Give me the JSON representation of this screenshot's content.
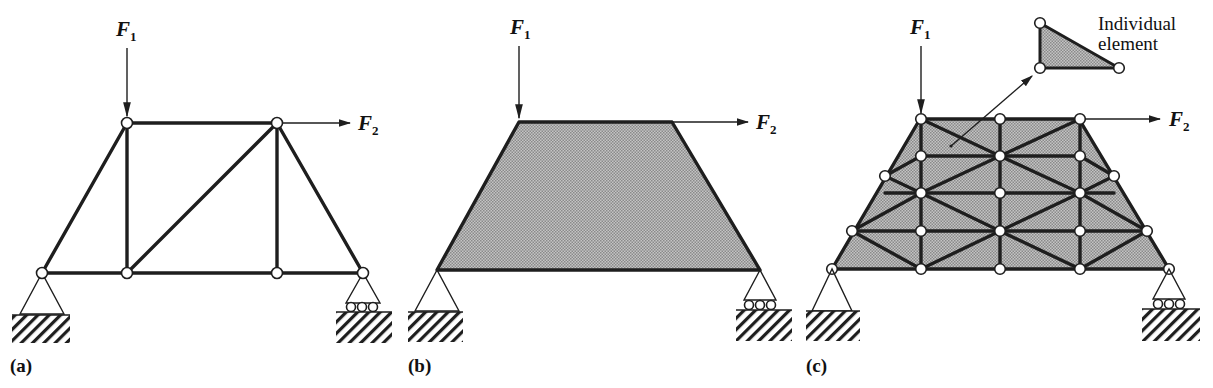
{
  "figure": {
    "panels": [
      {
        "id": "a",
        "label": "(a)",
        "description": "Truss structure",
        "forces": [
          {
            "name": "F",
            "subscript": "1",
            "direction": "down"
          },
          {
            "name": "F",
            "subscript": "2",
            "direction": "right"
          }
        ],
        "supports": [
          "pin",
          "roller"
        ]
      },
      {
        "id": "b",
        "label": "(b)",
        "description": "Continuous trapezoidal body",
        "forces": [
          {
            "name": "F",
            "subscript": "1",
            "direction": "down"
          },
          {
            "name": "F",
            "subscript": "2",
            "direction": "right"
          }
        ],
        "supports": [
          "pin",
          "roller"
        ]
      },
      {
        "id": "c",
        "label": "(c)",
        "description": "Finite element mesh of triangular elements",
        "forces": [
          {
            "name": "F",
            "subscript": "1",
            "direction": "down"
          },
          {
            "name": "F",
            "subscript": "2",
            "direction": "right"
          }
        ],
        "supports": [
          "pin",
          "roller"
        ],
        "callout": {
          "line1": "Individual",
          "line2": "element"
        }
      }
    ],
    "colors": {
      "line": "#1e1e1e",
      "fill_shaded": "#a9a9a9",
      "node_fill": "#ffffff",
      "background": "#ffffff"
    }
  }
}
